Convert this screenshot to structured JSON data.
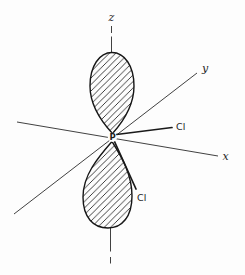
{
  "figure": {
    "type": "orbital-bonding-diagram",
    "axes": {
      "z": "z",
      "y": "y",
      "x": "x"
    },
    "center_atom": "P",
    "bonds": [
      {
        "label": "Cl",
        "position": "upper-right"
      },
      {
        "label": "Cl",
        "position": "lower-right"
      }
    ],
    "orbital": {
      "lobes": 2,
      "fill_style": "diagonal-hatch",
      "orientation": "z-axis"
    },
    "colors": {
      "ink": "#1f1f1f",
      "background": "#fdfdfd"
    }
  }
}
